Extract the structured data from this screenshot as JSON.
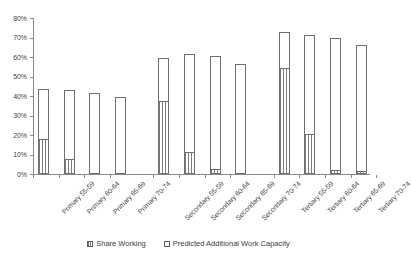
{
  "chart_data": {
    "type": "bar",
    "title": "",
    "subtitle": "",
    "xlabel": "",
    "ylabel": "",
    "ylim": [
      0,
      80
    ],
    "ytick_labels": [
      "0%",
      "10%",
      "20%",
      "30%",
      "40%",
      "50%",
      "60%",
      "70%",
      "80%"
    ],
    "ytick_values": [
      0,
      10,
      20,
      30,
      40,
      50,
      60,
      70,
      80
    ],
    "grid": false,
    "stacked": true,
    "legend_position": "bottom",
    "value_label_unit": "%",
    "categories": [
      "Primary 55-59",
      "Primary 60-64",
      "Primary 65-69",
      "Primary 70-74",
      "Secondary 55-59",
      "Secondary 60-64",
      "Secondary 65-69",
      "Secondary 70-74",
      "Tertiary 55-59",
      "Tertiary 60-64",
      "Tertiary 65-69",
      "Tertiary 70-74"
    ],
    "series": [
      {
        "name": "Share Working",
        "fill": "hatched-vertical-lines",
        "values": [
          17.8,
          7.9,
          0.0,
          0.0,
          37.5,
          11.5,
          2.5,
          0.0,
          54.5,
          20.4,
          2.3,
          1.3
        ]
      },
      {
        "name": "Predicted Additional Work Capacity",
        "fill": "white",
        "values": [
          25.6,
          35.3,
          41.3,
          39.7,
          21.9,
          50.1,
          57.8,
          56.5,
          18.4,
          51.1,
          67.2,
          64.6
        ]
      }
    ],
    "totals": [
      43.4,
      43.2,
      41.3,
      39.7,
      59.4,
      61.6,
      60.3,
      56.5,
      72.9,
      71.5,
      69.5,
      65.9
    ],
    "data_labels": [
      "25.6%",
      "35.3%",
      "41.3%",
      "39.7%",
      "21.9%",
      "50.1%",
      "57.8%",
      "56.5%",
      "18.4%",
      "51.1%",
      "67.2%",
      "64.6%"
    ],
    "group_breaks_after": [
      3,
      7
    ]
  },
  "legend": {
    "items": [
      {
        "label": "Share Working",
        "swatch": "hatched"
      },
      {
        "label": "Predicted Additional Work Capacity",
        "swatch": "white"
      }
    ]
  },
  "colors": {
    "axis": "#8a8a8a",
    "bar_border": "#6f6f6f",
    "hatch": "#7a7a7a",
    "bar_fill": "#ffffff",
    "text": "#3b3b3b",
    "background": "#ffffff"
  }
}
